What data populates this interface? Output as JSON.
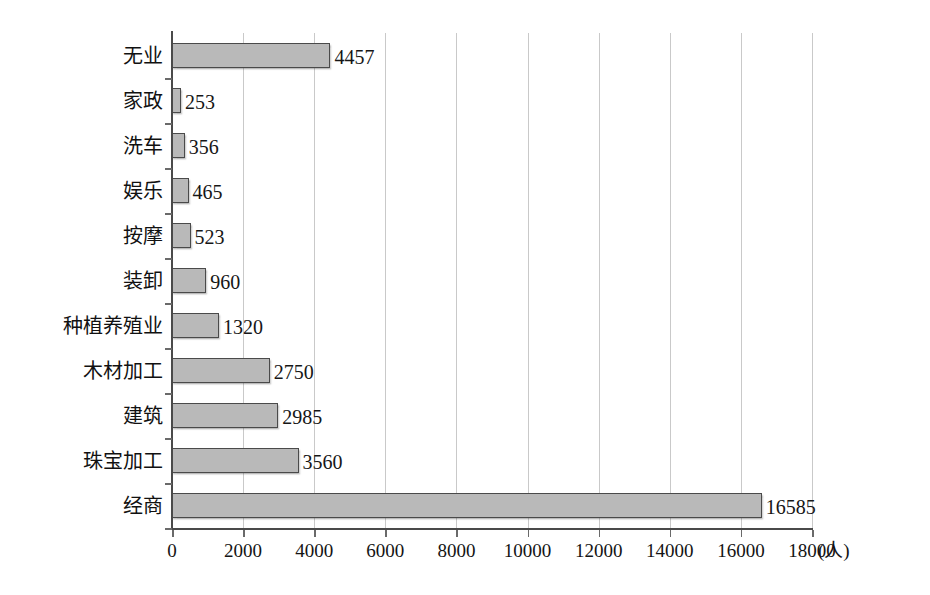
{
  "chart_data": {
    "type": "bar",
    "orientation": "horizontal",
    "title": "",
    "subtitle": "",
    "xlabel": "(人)",
    "ylabel": "",
    "xlim": [
      0,
      18000
    ],
    "xticks": [
      0,
      2000,
      4000,
      6000,
      8000,
      10000,
      12000,
      14000,
      16000,
      18000
    ],
    "xtick_labels": [
      "0",
      "2000",
      "4000",
      "6000",
      "8000",
      "10000",
      "12000",
      "14000",
      "16000",
      "18000"
    ],
    "grid": true,
    "grid_axis": "x",
    "legend": null,
    "legend_position": "none",
    "bar_color": "#b9b9b9",
    "bar_border_color": "#4a4a4a",
    "categories": [
      "无业",
      "家政",
      "洗车",
      "娱乐",
      "按摩",
      "装卸",
      "种植养殖业",
      "木材加工",
      "建筑",
      "珠宝加工",
      "经商"
    ],
    "values": [
      4457,
      253,
      356,
      465,
      523,
      960,
      1320,
      2750,
      2985,
      3560,
      16585
    ],
    "value_labels": [
      "4457",
      "253",
      "356",
      "465",
      "523",
      "960",
      "1320",
      "2750",
      "2985",
      "3560",
      "16585"
    ],
    "bars": [
      {
        "category": "无业",
        "value": 4457,
        "label": "4457"
      },
      {
        "category": "家政",
        "value": 253,
        "label": "253"
      },
      {
        "category": "洗车",
        "value": 356,
        "label": "356"
      },
      {
        "category": "娱乐",
        "value": 465,
        "label": "465"
      },
      {
        "category": "按摩",
        "value": 523,
        "label": "523"
      },
      {
        "category": "装卸",
        "value": 960,
        "label": "960"
      },
      {
        "category": "种植养殖业",
        "value": 1320,
        "label": "1320"
      },
      {
        "category": "木材加工",
        "value": 2750,
        "label": "2750"
      },
      {
        "category": "建筑",
        "value": 2985,
        "label": "2985"
      },
      {
        "category": "珠宝加工",
        "value": 3560,
        "label": "3560"
      },
      {
        "category": "经商",
        "value": 16585,
        "label": "16585"
      }
    ]
  }
}
